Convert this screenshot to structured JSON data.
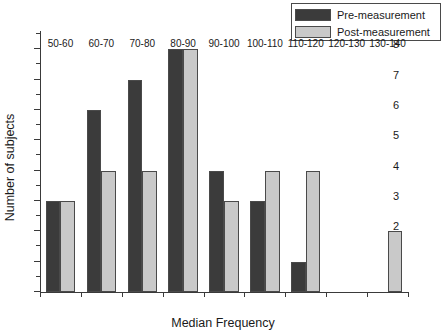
{
  "chart_data": {
    "type": "bar",
    "title": "",
    "xlabel": "Median Frequency",
    "ylabel": "Number of subjects",
    "categories": [
      "50-60",
      "60-70",
      "70-80",
      "80-90",
      "90-100",
      "100-110",
      "110-120",
      "120-130",
      "130-140"
    ],
    "series": [
      {
        "name": "Pre-measurement",
        "color": "#3b3b3b",
        "values": [
          3,
          6,
          7,
          8,
          4,
          3,
          1,
          0,
          0
        ]
      },
      {
        "name": "Post-measurement",
        "color": "#c9c9c9",
        "values": [
          3,
          4,
          4,
          8,
          3,
          4,
          4,
          0,
          2
        ]
      }
    ],
    "ylim": [
      0,
      8.6
    ],
    "yticks": [
      0,
      1,
      2,
      3,
      4,
      5,
      6,
      7,
      8
    ],
    "ytick_labels": [
      "0",
      "1",
      "2",
      "3",
      "4",
      "5",
      "6",
      "7",
      "8"
    ],
    "minor_yticks": [
      0.5,
      1.5,
      2.5,
      3.5,
      4.5,
      5.5,
      6.5,
      7.5,
      8.5
    ],
    "grid": false,
    "legend_position": "top-right"
  },
  "legend": {
    "entries": [
      {
        "label": "Pre-measurement",
        "swatch": "#3b3b3b"
      },
      {
        "label": "Post-measurement",
        "swatch": "#c9c9c9"
      }
    ]
  }
}
